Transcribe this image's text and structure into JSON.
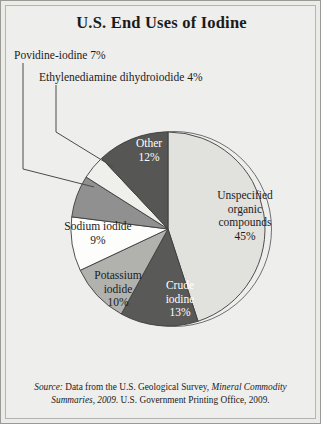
{
  "chart_data": {
    "type": "pie",
    "title": "U.S. End Uses of Iodine",
    "xlabel": "",
    "ylabel": "",
    "legend_position": "none",
    "grid": false,
    "units": "percent",
    "categories": [
      "Unspecified organic compounds",
      "Crude iodine",
      "Potassium iodide",
      "Sodium iodide",
      "Povidine-iodine",
      "Ethylenediamine dihydroiodide",
      "Other"
    ],
    "values": [
      45,
      13,
      10,
      9,
      7,
      4,
      12
    ],
    "slices": [
      {
        "name": "unspecified-organic-compounds",
        "label": "Unspecified organic compounds",
        "label_lines": [
          "Unspecified",
          "organic",
          "compounds",
          "45%"
        ],
        "value": 45,
        "value_text": "45%",
        "color": "#e1e1dd",
        "label_color": "#1b1b1b",
        "label_placement": "inside"
      },
      {
        "name": "crude-iodine",
        "label": "Crude iodine",
        "label_lines": [
          "Crude",
          "iodine",
          "13%"
        ],
        "value": 13,
        "value_text": "13%",
        "color": "#595957",
        "label_color": "#ffffff",
        "label_placement": "inside"
      },
      {
        "name": "potassium-iodide",
        "label": "Potassium iodide",
        "label_lines": [
          "Potassium",
          "iodide",
          "10%"
        ],
        "value": 10,
        "value_text": "10%",
        "color": "#b1b1ad",
        "label_color": "#1b1b1b",
        "label_placement": "inside"
      },
      {
        "name": "sodium-iodide",
        "label": "Sodium iodide",
        "label_lines": [
          "Sodium iodide",
          "9%"
        ],
        "value": 9,
        "value_text": "9%",
        "color": "#fdfdfb",
        "label_color": "#1b1b1b",
        "label_placement": "inside"
      },
      {
        "name": "povidine-iodine",
        "label": "Povidine-iodine",
        "value": 7,
        "value_text": "7%",
        "color": "#909090",
        "label_color": "#1b1b1b",
        "label_placement": "callout"
      },
      {
        "name": "ethylenediamine-dihydroiodide",
        "label": "Ethylenediamine dihydroiodide",
        "value": 4,
        "value_text": "4%",
        "color": "#efefeb",
        "label_color": "#1b1b1b",
        "label_placement": "callout"
      },
      {
        "name": "other",
        "label": "Other",
        "label_lines": [
          "Other",
          "12%"
        ],
        "value": 12,
        "value_text": "12%",
        "color": "#565654",
        "label_color": "#ffffff",
        "label_placement": "inside"
      }
    ]
  },
  "title": "U.S. End Uses of Iodine",
  "callouts": {
    "povidine": "Povidine-iodine 7%",
    "ethylenediamine": "Ethylenediamine dihydroiodide 4%"
  },
  "slice_labels": {
    "unspecified_l1": "Unspecified",
    "unspecified_l2": "organic",
    "unspecified_l3": "compounds",
    "unspecified_l4": "45%",
    "other_l1": "Other",
    "other_l2": "12%",
    "crude_l1": "Crude",
    "crude_l2": "iodine",
    "crude_l3": "13%",
    "potassium_l1": "Potassium",
    "potassium_l2": "iodide",
    "potassium_l3": "10%",
    "sodium_l1": "Sodium iodide",
    "sodium_l2": "9%"
  },
  "source": {
    "prefix": "Source:",
    "text_a": " Data from the U.S. Geological Survey, ",
    "publication": "Mineral Commodity Summaries, 2009.",
    "text_b": " U.S. Government Printing Office, 2009."
  },
  "colors": {
    "frame_border": "#9a9a96",
    "background": "#eeeeec",
    "slice_stroke": "#3d3d3d",
    "text": "#1b1b1b"
  }
}
